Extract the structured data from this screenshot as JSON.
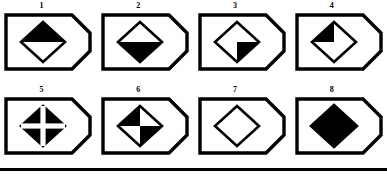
{
  "sheet": {
    "title": "Diamond fill-pattern figure series",
    "columns": 4,
    "rows": 2,
    "stroke_color": "#000000",
    "fill_color": "#000000",
    "background_color": "#ffffff",
    "bottom_rule": true
  },
  "figures": [
    {
      "number": "1",
      "frame": "pentagon-tag-right-point",
      "shape": "diamond",
      "fill_pattern": "top-half",
      "description": "Diamond with upper half filled black, lower half white"
    },
    {
      "number": "2",
      "frame": "pentagon-tag-right-point",
      "shape": "diamond",
      "fill_pattern": "bottom-half",
      "description": "Diamond with lower half filled black, upper half white"
    },
    {
      "number": "3",
      "frame": "pentagon-tag-right-point",
      "shape": "diamond",
      "fill_pattern": "bottom-right-quadrant",
      "description": "Diamond with bottom-right quadrant filled black"
    },
    {
      "number": "4",
      "frame": "pentagon-tag-right-point",
      "shape": "diamond",
      "fill_pattern": "top-left-quadrant",
      "description": "Diamond with top-left quadrant filled black"
    },
    {
      "number": "5",
      "frame": "pentagon-tag-right-point",
      "shape": "diamond",
      "fill_pattern": "solid-with-white-cross",
      "description": "Solid black diamond crossed by a white vertical and horizontal bar"
    },
    {
      "number": "6",
      "frame": "pentagon-tag-right-point",
      "shape": "diamond",
      "fill_pattern": "checkerboard-quadrants",
      "description": "Diamond with top-left and bottom-right quadrants filled black"
    },
    {
      "number": "7",
      "frame": "pentagon-tag-right-point",
      "shape": "diamond",
      "fill_pattern": "empty",
      "description": "Empty white diamond outline"
    },
    {
      "number": "8",
      "frame": "pentagon-tag-right-point",
      "shape": "diamond",
      "fill_pattern": "solid",
      "description": "Fully solid black diamond"
    }
  ]
}
